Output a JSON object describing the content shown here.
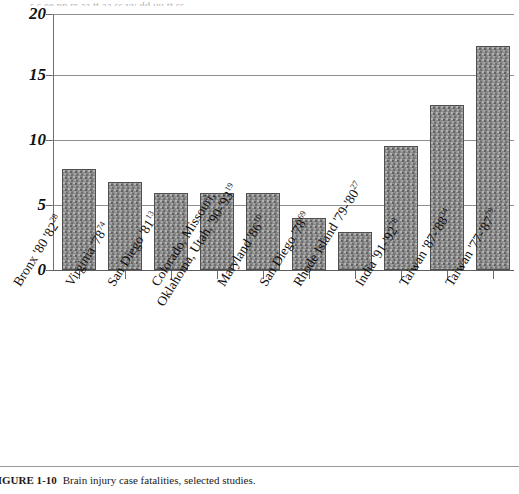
{
  "figure": {
    "top_clipped_text": "s s ee pp rr aa tt aa   ss yy dd uu tt ss",
    "caption_number": "FIGURE 1-10",
    "caption_text": "Brain injury case fatalities, selected studies."
  },
  "chart_data": {
    "type": "bar",
    "title": "Brain injury case fatalities, selected studies",
    "xlabel": "",
    "ylabel": "",
    "ylim": [
      0,
      20
    ],
    "ytick_labels": [
      "0",
      "5",
      "10",
      "15",
      "20"
    ],
    "ytick_values": [
      0,
      5,
      10,
      15,
      20
    ],
    "grid": true,
    "legend": "none",
    "bar_color": "#8a8a8a",
    "categories": [
      "Bronx '80 '82",
      "Virginia '78",
      "San Diego '81",
      "Colorado, Missouri, Oklahoma, Utah, '90-'93",
      "Maryland '86",
      "San Diego '78",
      "Rhode Island '79-'80",
      "India '91-'92",
      "Taiwan '87-'88",
      "Taiwan '77-'87"
    ],
    "category_lines": [
      [
        "Bronx '80 '82"
      ],
      [
        "Virginia '78"
      ],
      [
        "San Diego '81"
      ],
      [
        "Colorado, Missouri,",
        "Oklahoma, Utah, '90-'93"
      ],
      [
        "Maryland '86"
      ],
      [
        "San Diego '78"
      ],
      [
        "Rhode Island '79-'80"
      ],
      [
        "India '91-'92"
      ],
      [
        "Taiwan '87-'88"
      ],
      [
        "Taiwan '77-'87"
      ]
    ],
    "reference_marks": [
      "28",
      "74",
      "13",
      "19",
      "10",
      "69",
      "27",
      "78",
      "34",
      "79"
    ],
    "values": [
      7.9,
      6.9,
      6.0,
      6.0,
      6.0,
      4.1,
      3.0,
      9.7,
      12.9,
      17.5
    ]
  }
}
